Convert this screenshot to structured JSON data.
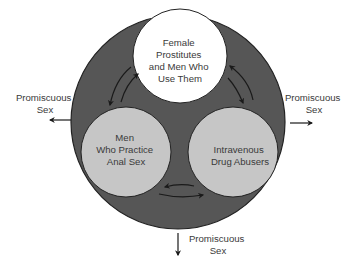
{
  "diagram": {
    "title": "",
    "outer_population": {
      "fill": "#565656"
    },
    "groups": [
      {
        "id": "prostitutes",
        "lines": [
          "Female",
          "Prostitutes",
          "and Men Who",
          "Use Them"
        ],
        "fill": "#ffffff"
      },
      {
        "id": "msm",
        "lines": [
          "Men",
          "Who Practice",
          "Anal Sex"
        ],
        "fill": "#c6c6c6"
      },
      {
        "id": "idu",
        "lines": [
          "Intravenous",
          "Drug Abusers"
        ],
        "fill": "#c6c6c6"
      }
    ],
    "links": [
      {
        "between": [
          "prostitutes",
          "msm"
        ],
        "direction": "bidirectional"
      },
      {
        "between": [
          "prostitutes",
          "idu"
        ],
        "direction": "bidirectional"
      },
      {
        "between": [
          "msm",
          "idu"
        ],
        "direction": "bidirectional"
      }
    ],
    "outflows": [
      {
        "id": "left",
        "direction": "left",
        "lines": [
          "Promiscuous",
          "Sex"
        ]
      },
      {
        "id": "right",
        "direction": "right",
        "lines": [
          "Promiscuous",
          "Sex"
        ]
      },
      {
        "id": "bottom",
        "direction": "down",
        "lines": [
          "Promiscuous",
          "Sex"
        ]
      }
    ],
    "colors": {
      "outline": "#222222",
      "arrow": "#1a1a1a",
      "text": "#3a3a3a"
    }
  }
}
